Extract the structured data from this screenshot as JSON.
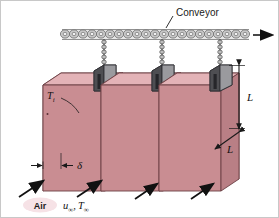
{
  "figure": {
    "title_label": "Conveyor",
    "motion_arrow": "right-arrow",
    "plate_label": "T",
    "plate_label_sub": "i",
    "height_label": "L",
    "depth_label": "L",
    "thickness_label": "δ",
    "air_label": "Air",
    "flow_label_velocity": "u",
    "flow_label_velocity_sub": "∞",
    "flow_label_temp": "T",
    "flow_label_temp_sub": "∞",
    "flow_label_comma": ",",
    "plate_count": 3,
    "airflow_arrow_count": 4
  },
  "colors": {
    "plate_face": "#c98d92",
    "plate_face_light": "#d9a0a5",
    "plate_edge": "#b97f85",
    "plate_top": "#e3b3b7",
    "clamp_dark": "#4e4e52",
    "clamp_mid": "#6e6e72",
    "clamp_light": "#9a9a9e",
    "chain": "#8c8c8c",
    "chain_light": "#d2d2d2",
    "air_blob": "#f6e2e6",
    "line": "#1a1a1a",
    "background": "#ffffff"
  }
}
